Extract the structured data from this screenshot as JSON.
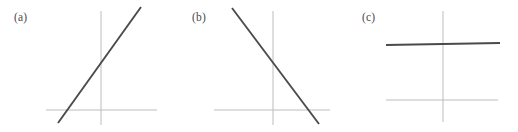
{
  "figure": {
    "width": 518,
    "height": 132,
    "background_color": "#ffffff",
    "axis_color": "#bdbdbd",
    "line_color": "#4a4a4a"
  },
  "panels": [
    {
      "label": "(a)",
      "label_x": 14,
      "label_y": 11,
      "origin_x": 101,
      "origin_y": 110,
      "x_axis": {
        "x1": 46,
        "y1": 110,
        "x2": 157,
        "y2": 110
      },
      "y_axis": {
        "x1": 101,
        "y1": 11,
        "x2": 101,
        "y2": 125
      },
      "data_line": {
        "x1": 58,
        "y1": 123,
        "x2": 141,
        "y2": 7
      },
      "slope_sign": "positive"
    },
    {
      "label": "(b)",
      "label_x": 192,
      "label_y": 11,
      "origin_x": 273,
      "origin_y": 110,
      "x_axis": {
        "x1": 214,
        "y1": 110,
        "x2": 330,
        "y2": 110
      },
      "y_axis": {
        "x1": 273,
        "y1": 11,
        "x2": 273,
        "y2": 125
      },
      "data_line": {
        "x1": 232,
        "y1": 8,
        "x2": 319,
        "y2": 124
      },
      "slope_sign": "negative"
    },
    {
      "label": "(c)",
      "label_x": 362,
      "label_y": 11,
      "origin_x": 443,
      "origin_y": 100,
      "x_axis": {
        "x1": 386,
        "y1": 100,
        "x2": 498,
        "y2": 100
      },
      "y_axis": {
        "x1": 443,
        "y1": 11,
        "x2": 443,
        "y2": 122
      },
      "data_line": {
        "x1": 386,
        "y1": 45,
        "x2": 500,
        "y2": 43
      },
      "slope_sign": "zero"
    }
  ],
  "chart_data": {
    "type": "line",
    "title": "",
    "xlabel": "",
    "ylabel": "",
    "grid": false,
    "legend": "none",
    "series": [
      {
        "name": "(a)",
        "slope": "positive",
        "x": [
          -1.0,
          1.0
        ],
        "y": [
          -0.25,
          1.75
        ],
        "xlim": [
          -1.3,
          1.3
        ],
        "ylim": [
          -0.45,
          1.85
        ]
      },
      {
        "name": "(b)",
        "slope": "negative",
        "x": [
          -1.0,
          1.0
        ],
        "y": [
          1.75,
          -0.25
        ],
        "xlim": [
          -1.3,
          1.3
        ],
        "ylim": [
          -0.45,
          1.85
        ]
      },
      {
        "name": "(c)",
        "slope": "zero",
        "x": [
          -1.0,
          1.0
        ],
        "y": [
          0.95,
          0.95
        ],
        "xlim": [
          -1.3,
          1.3
        ],
        "ylim": [
          -0.45,
          1.85
        ]
      }
    ]
  }
}
